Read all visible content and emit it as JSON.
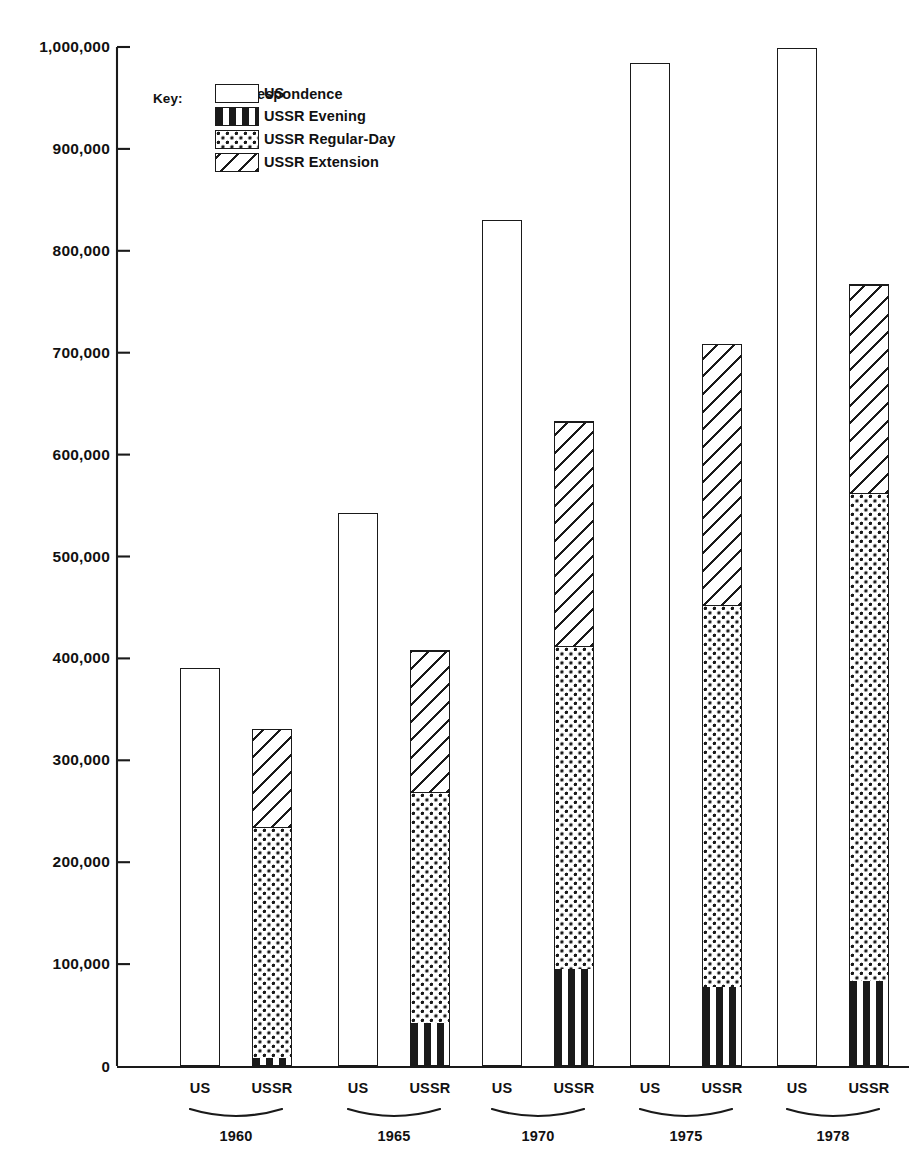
{
  "chart_data": {
    "type": "bar",
    "title": "",
    "subtitle": "",
    "xlabel": "",
    "ylabel": "",
    "ylim": [
      0,
      1000000
    ],
    "grid": false,
    "stacked": true,
    "legend_position": "inside-top-left",
    "categories": [
      "1960",
      "1965",
      "1970",
      "1975",
      "1978"
    ],
    "group_labels": [
      "US",
      "USSR"
    ],
    "ytick_labels": [
      "1,000,000",
      "900,000",
      "800,000",
      "700,000",
      "600,000",
      "500,000",
      "400,000",
      "300,000",
      "200,000",
      "100,000",
      "0"
    ],
    "ytick_values": [
      1000000,
      900000,
      800000,
      700000,
      600000,
      500000,
      400000,
      300000,
      200000,
      100000,
      0
    ],
    "series": [
      {
        "name": "US",
        "group": "US",
        "pattern": "plain",
        "values": [
          391000,
          543000,
          830000,
          984000,
          999000
        ]
      },
      {
        "name": "USSR Evening",
        "group": "USSR",
        "pattern": "evening",
        "values": [
          9000,
          43000,
          96000,
          78000,
          84000
        ]
      },
      {
        "name": "USSR Regular-Day",
        "group": "USSR",
        "pattern": "day",
        "values": [
          226000,
          227000,
          317000,
          375000,
          479000
        ]
      },
      {
        "name": "USSR Extension Correspondence",
        "group": "USSR",
        "pattern": "extension",
        "values": [
          96000,
          138000,
          220000,
          256000,
          204000
        ]
      }
    ],
    "ussr_totals": [
      331000,
      408000,
      633000,
      709000,
      767000
    ],
    "annotations": []
  },
  "legend": {
    "title": "Key:",
    "items": [
      {
        "label": "US",
        "pattern": "plain"
      },
      {
        "label": "USSR Evening",
        "pattern": "evening"
      },
      {
        "label": "USSR Regular-Day",
        "pattern": "day"
      },
      {
        "label": "USSR Extension",
        "pattern": "extension"
      }
    ],
    "continuation_label": "Correspondence"
  },
  "colors": {
    "ink": "#1a1a1a",
    "background": "#ffffff"
  }
}
